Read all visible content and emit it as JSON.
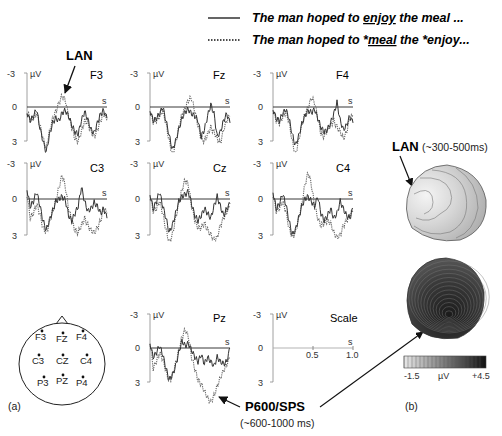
{
  "legend": {
    "solid": {
      "text_pre": "The man hoped to ",
      "text_u": "enjoy",
      "text_post": " the meal ..."
    },
    "dotted": {
      "text_pre": "The man hoped to *",
      "text_u": "meal",
      "text_post": " the *enjoy..."
    }
  },
  "annotations": {
    "lan_top": "LAN",
    "lan_map": "LAN",
    "lan_map_window": "(~300-500ms)",
    "p600": "P600/SPS",
    "p600_window": "(~600-1000 ms)"
  },
  "axis": {
    "neg": "-3",
    "zero": "0",
    "pos": "3",
    "unit": "µV",
    "time_unit": "s"
  },
  "panels": [
    {
      "channel": "F3"
    },
    {
      "channel": "Fz"
    },
    {
      "channel": "F4"
    },
    {
      "channel": "C3"
    },
    {
      "channel": "Cz"
    },
    {
      "channel": "C4"
    },
    {
      "channel": "Pz"
    },
    {
      "channel": "Scale"
    }
  ],
  "scale": {
    "tick1": "0.5",
    "tick2": "1.0"
  },
  "head_map": {
    "electrodes": [
      "F3",
      "FZ",
      "F4",
      "C3",
      "CZ",
      "C4",
      "P3",
      "PZ",
      "P4"
    ]
  },
  "colorbar": {
    "min": "-1.5",
    "unit": "µV",
    "max": "+4.5"
  },
  "panel_labels": {
    "a": "(a)",
    "b": "(b)"
  },
  "chart_data": {
    "type": "line",
    "xlabel": "time (s)",
    "ylabel": "µV (negative up)",
    "xlim": [
      0,
      1.0
    ],
    "ylim": [
      -3,
      3
    ],
    "y_inverted": true,
    "series_names": [
      "The man hoped to enjoy the meal ... (solid)",
      "The man hoped to *meal the *enjoy... (dotted)"
    ],
    "channels": {
      "F3": {
        "solid": [
          0.5,
          1.2,
          0.8,
          0.2,
          1.8,
          3.0,
          4.0,
          2.5,
          1.4,
          1.0,
          1.2,
          0.5,
          0.3,
          0.8,
          1.6,
          2.2,
          2.4,
          1.2,
          0.4,
          1.1,
          2.0,
          2.3,
          1.4,
          0.6,
          0.3,
          1.0
        ],
        "dotted": [
          0.4,
          1.1,
          1.0,
          0.5,
          1.6,
          2.8,
          3.6,
          2.2,
          1.0,
          0.4,
          -0.4,
          -1.0,
          -0.6,
          0.8,
          1.8,
          2.8,
          3.0,
          2.2,
          1.2,
          1.4,
          2.2,
          2.6,
          2.0,
          1.2,
          0.6,
          1.2
        ]
      },
      "Fz": {
        "solid": [
          0.3,
          1.2,
          1.0,
          0.6,
          0.0,
          1.2,
          2.5,
          3.8,
          3.0,
          2.0,
          1.0,
          0.4,
          0.2,
          0.6,
          0.8,
          1.2,
          2.6,
          2.0,
          0.8,
          -0.2,
          0.6,
          2.6,
          2.2,
          1.2,
          0.6,
          1.4
        ],
        "dotted": [
          0.4,
          1.3,
          1.2,
          0.8,
          0.3,
          1.5,
          3.0,
          4.2,
          3.2,
          1.8,
          0.6,
          0.1,
          -0.6,
          -0.8,
          0.4,
          1.6,
          2.8,
          3.0,
          2.4,
          1.8,
          2.2,
          2.8,
          3.2,
          2.0,
          1.2,
          0.8
        ]
      },
      "F4": {
        "solid": [
          0.2,
          1.0,
          1.2,
          0.6,
          0.2,
          1.0,
          2.4,
          3.4,
          2.6,
          1.5,
          0.8,
          0.3,
          0.5,
          0.2,
          1.0,
          1.8,
          2.2,
          2.0,
          1.4,
          0.6,
          -0.4,
          1.2,
          2.0,
          1.6,
          0.8,
          1.4
        ],
        "dotted": [
          0.3,
          1.2,
          1.4,
          0.9,
          0.4,
          1.3,
          3.0,
          4.2,
          3.0,
          1.6,
          0.6,
          0.0,
          -0.8,
          -0.4,
          1.0,
          2.4,
          2.6,
          2.0,
          1.6,
          1.2,
          1.8,
          2.2,
          2.8,
          2.2,
          1.0,
          0.8
        ]
      },
      "C3": {
        "solid": [
          -0.8,
          0.6,
          0.2,
          -0.6,
          0.5,
          1.8,
          2.6,
          1.8,
          1.0,
          0.2,
          0.0,
          -0.2,
          0.1,
          1.4,
          1.8,
          1.2,
          0.6,
          -1.0,
          0.2,
          1.0,
          0.8,
          0.3,
          0.6,
          1.2,
          0.8,
          1.6
        ],
        "dotted": [
          -0.4,
          1.6,
          1.2,
          0.4,
          1.2,
          2.4,
          2.8,
          2.0,
          1.0,
          0.2,
          -1.0,
          -2.0,
          -1.0,
          0.8,
          1.8,
          2.6,
          2.8,
          2.2,
          1.6,
          2.2,
          2.6,
          2.8,
          2.4,
          1.8,
          0.8,
          1.2
        ]
      },
      "Cz": {
        "solid": [
          -0.4,
          0.8,
          0.2,
          -0.6,
          0.6,
          1.6,
          2.8,
          2.2,
          1.2,
          0.2,
          -0.2,
          -0.4,
          -0.6,
          0.4,
          1.4,
          1.8,
          1.4,
          0.8,
          1.2,
          1.6,
          0.6,
          -0.2,
          0.6,
          1.4,
          0.8,
          0.4
        ],
        "dotted": [
          -0.2,
          1.0,
          0.8,
          0.2,
          1.2,
          2.6,
          3.6,
          3.0,
          1.6,
          0.4,
          -0.8,
          -1.6,
          -1.2,
          0.6,
          1.8,
          2.4,
          2.4,
          2.0,
          2.6,
          3.0,
          3.4,
          3.2,
          2.2,
          1.6,
          1.0,
          0.6
        ]
      },
      "C4": {
        "solid": [
          -0.6,
          0.8,
          0.4,
          -0.4,
          0.4,
          1.8,
          3.0,
          2.6,
          1.6,
          0.6,
          0.0,
          -0.2,
          0.2,
          0.6,
          -0.2,
          1.2,
          1.8,
          1.4,
          0.8,
          1.6,
          1.2,
          0.2,
          0.8,
          1.4,
          1.6,
          0.8
        ],
        "dotted": [
          -0.4,
          1.0,
          0.8,
          0.2,
          1.0,
          2.4,
          3.2,
          2.8,
          1.6,
          0.4,
          -1.2,
          -2.2,
          -1.2,
          0.6,
          1.6,
          2.2,
          2.0,
          1.8,
          2.0,
          2.8,
          3.2,
          3.0,
          2.2,
          1.8,
          1.4,
          1.0
        ]
      },
      "Pz": {
        "solid": [
          -0.4,
          0.8,
          0.4,
          -0.2,
          0.6,
          1.8,
          2.8,
          2.4,
          1.6,
          0.4,
          -0.6,
          -0.2,
          -0.4,
          0.2,
          0.8,
          1.2,
          0.6,
          1.4,
          0.8,
          1.2,
          1.6,
          0.8,
          1.2,
          1.4,
          1.2,
          0.0
        ],
        "dotted": [
          -0.6,
          1.8,
          1.2,
          0.4,
          1.0,
          2.0,
          3.0,
          2.4,
          1.4,
          0.2,
          -1.0,
          -1.6,
          -1.0,
          0.8,
          1.8,
          2.8,
          3.2,
          3.8,
          4.4,
          4.8,
          4.2,
          3.4,
          2.6,
          2.0,
          1.4,
          0.8
        ]
      }
    },
    "topomaps": [
      {
        "label": "LAN (~300-500ms)",
        "note": "left anterior negativity, frontal-left focus"
      },
      {
        "label": "P600/SPS (~600-1000 ms)",
        "note": "broad posterior positivity"
      }
    ],
    "colorbar_range": [
      -1.5,
      4.5
    ]
  }
}
